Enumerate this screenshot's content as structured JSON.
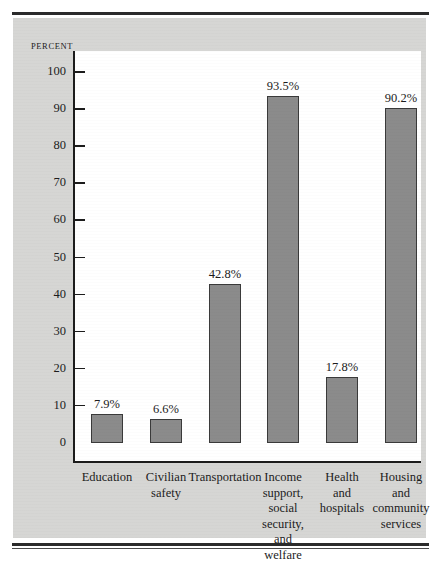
{
  "figure": {
    "axis_title": "PERCENT"
  },
  "chart_data": {
    "type": "bar",
    "title": "",
    "xlabel": "",
    "ylabel": "PERCENT",
    "ylim": [
      0,
      105
    ],
    "yticks": [
      0,
      10,
      20,
      30,
      40,
      50,
      60,
      70,
      80,
      90,
      100
    ],
    "ytick_labels": [
      "0",
      "10",
      "20",
      "30",
      "40",
      "50",
      "60",
      "70",
      "80",
      "90",
      "100"
    ],
    "grid": false,
    "legend": null,
    "categories": [
      "Education",
      "Civilian safety",
      "Transportation",
      "Income support, social security, and welfare",
      "Health and hospitals",
      "Housing and community services"
    ],
    "category_label_lines": [
      [
        "Education"
      ],
      [
        "Civilian",
        "safety"
      ],
      [
        "Transportation"
      ],
      [
        "Income",
        "support,",
        "social",
        "security,",
        "and",
        "welfare"
      ],
      [
        "Health",
        "and",
        "hospitals"
      ],
      [
        "Housing",
        "and",
        "community",
        "services"
      ]
    ],
    "values": [
      7.9,
      6.6,
      42.8,
      93.5,
      17.8,
      90.2
    ],
    "value_labels": [
      "7.9%",
      "6.6%",
      "42.8%",
      "93.5%",
      "17.8%",
      "90.2%"
    ],
    "colors": {
      "bar_fill": "#8b8b8b",
      "bar_edge": "#3a3a3a",
      "panel_background": "#d6d6d4",
      "plot_background": "#ffffff",
      "axis": "#1c1c1c",
      "text": "#1c1c1c"
    }
  }
}
